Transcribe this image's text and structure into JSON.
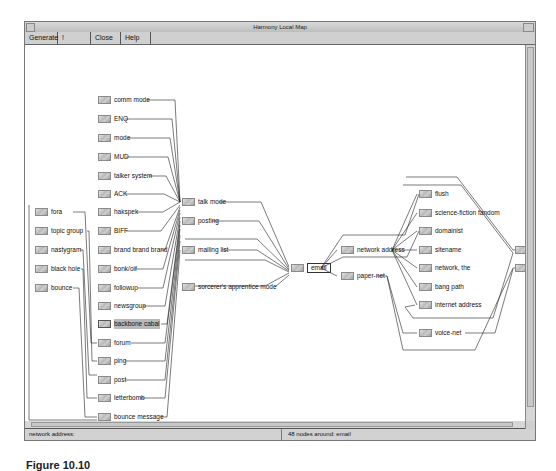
{
  "window": {
    "title": "Harmony Local Map"
  },
  "menu": [
    {
      "label": "Generate"
    },
    {
      "label": "! Options"
    },
    {
      "label": "Close"
    },
    {
      "label": "Help"
    }
  ],
  "graph": {
    "nodes": [
      {
        "id": "fora",
        "label": "fora",
        "x": 10,
        "y": 162
      },
      {
        "id": "topic_group",
        "label": "topic group",
        "x": 10,
        "y": 181
      },
      {
        "id": "nastygram",
        "label": "nastygram",
        "x": 10,
        "y": 200
      },
      {
        "id": "black_hole",
        "label": "black hole",
        "x": 10,
        "y": 219
      },
      {
        "id": "bounce",
        "label": "bounce",
        "x": 10,
        "y": 238
      },
      {
        "id": "comm_mode",
        "label": "comm mode",
        "x": 73,
        "y": 50
      },
      {
        "id": "enq",
        "label": "ENQ",
        "x": 73,
        "y": 69
      },
      {
        "id": "mode",
        "label": "mode",
        "x": 73,
        "y": 88
      },
      {
        "id": "mud",
        "label": "MUD",
        "x": 73,
        "y": 107
      },
      {
        "id": "talker_system",
        "label": "talker system",
        "x": 73,
        "y": 126
      },
      {
        "id": "ack",
        "label": "ACK",
        "x": 73,
        "y": 144
      },
      {
        "id": "hakspek",
        "label": "hakspek",
        "x": 73,
        "y": 162
      },
      {
        "id": "biff",
        "label": "BIFF",
        "x": 73,
        "y": 181
      },
      {
        "id": "brand3",
        "label": "brand brand brand",
        "x": 73,
        "y": 200
      },
      {
        "id": "bonk_oif",
        "label": "bonk/oif",
        "x": 73,
        "y": 219
      },
      {
        "id": "followup",
        "label": "followup",
        "x": 73,
        "y": 238
      },
      {
        "id": "newsgroup",
        "label": "newsgroup",
        "x": 73,
        "y": 256
      },
      {
        "id": "backbone_cabal",
        "label": "backbone cabal",
        "x": 73,
        "y": 274,
        "highlight": true
      },
      {
        "id": "forum",
        "label": "forum",
        "x": 73,
        "y": 293
      },
      {
        "id": "ping",
        "label": "ping",
        "x": 73,
        "y": 311
      },
      {
        "id": "post",
        "label": "post",
        "x": 73,
        "y": 330
      },
      {
        "id": "letterbomb",
        "label": "letterbomb",
        "x": 73,
        "y": 348
      },
      {
        "id": "bounce_message",
        "label": "bounce message",
        "x": 73,
        "y": 367
      },
      {
        "id": "talk_mode",
        "label": "talk mode",
        "x": 157,
        "y": 152
      },
      {
        "id": "posting",
        "label": "posting",
        "x": 157,
        "y": 171
      },
      {
        "id": "mailing_list",
        "label": "mailing list",
        "x": 157,
        "y": 200
      },
      {
        "id": "sorcerer",
        "label": "sorcerer's apprentice mode",
        "x": 157,
        "y": 237
      },
      {
        "id": "email",
        "label": "email",
        "x": 266,
        "y": 218,
        "boxed": true
      },
      {
        "id": "network_address",
        "label": "network address",
        "x": 316,
        "y": 200
      },
      {
        "id": "paper_net",
        "label": "paper-net",
        "x": 316,
        "y": 226
      },
      {
        "id": "flush",
        "label": "flush",
        "x": 394,
        "y": 144
      },
      {
        "id": "sf_fandom",
        "label": "science-fiction fandom",
        "x": 394,
        "y": 163
      },
      {
        "id": "domainist",
        "label": "domainist",
        "x": 394,
        "y": 181
      },
      {
        "id": "sitename",
        "label": "sitename",
        "x": 394,
        "y": 200
      },
      {
        "id": "network_the",
        "label": "network, the",
        "x": 394,
        "y": 218
      },
      {
        "id": "bang_path",
        "label": "bang path",
        "x": 394,
        "y": 237
      },
      {
        "id": "internet_address",
        "label": "internet address",
        "x": 394,
        "y": 255
      },
      {
        "id": "voice_net",
        "label": "voice-net",
        "x": 394,
        "y": 283
      },
      {
        "id": "right1",
        "label": "",
        "x": 490,
        "y": 200
      },
      {
        "id": "right2",
        "label": "",
        "x": 490,
        "y": 218
      }
    ]
  },
  "status": {
    "left": "network address:",
    "right": "48 nodes around: email"
  },
  "caption": "Figure 10.10"
}
